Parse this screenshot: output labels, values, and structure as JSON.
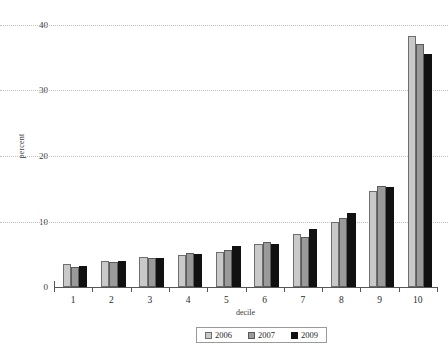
{
  "chart_data": {
    "type": "bar",
    "title": "",
    "subtitle": "",
    "xlabel": "decile",
    "ylabel": "percent",
    "categories": [
      "1",
      "2",
      "3",
      "4",
      "5",
      "6",
      "7",
      "8",
      "9",
      "10"
    ],
    "series": [
      {
        "name": "2006",
        "color": "#c9c9c9",
        "values": [
          3.5,
          4.0,
          4.6,
          4.9,
          5.4,
          6.6,
          8.1,
          9.9,
          14.6,
          38.3
        ]
      },
      {
        "name": "2007",
        "color": "#9a9a9a",
        "values": [
          3.0,
          3.8,
          4.5,
          5.2,
          5.7,
          6.8,
          7.7,
          10.6,
          15.4,
          37.1
        ]
      },
      {
        "name": "2009",
        "color": "#111111",
        "values": [
          3.2,
          3.9,
          4.4,
          5.1,
          6.2,
          6.5,
          8.8,
          11.3,
          15.3,
          35.6
        ]
      }
    ],
    "ylim": [
      0,
      40
    ],
    "yticks": [
      0,
      10,
      20,
      30,
      40
    ],
    "ytick_labels": [
      "0",
      "10",
      "20",
      "30",
      "40"
    ],
    "grid": "horizontal-dotted",
    "legend_position": "bottom-center",
    "legend_entries": [
      "2006",
      "2007",
      "2009"
    ]
  }
}
